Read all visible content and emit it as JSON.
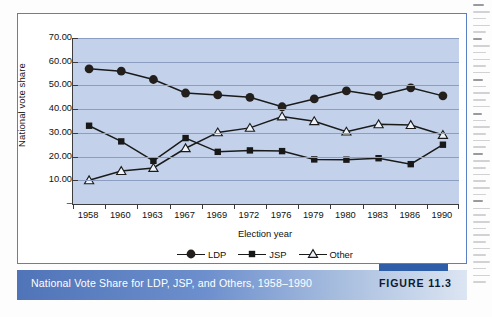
{
  "figure": {
    "caption": "National Vote Share for LDP, JSP, and Others, 1958–1990",
    "number_label": "FIGURE 11.3"
  },
  "chart_data": {
    "type": "line",
    "title": "National Vote Share for LDP, JSP, and Others, 1958–1990",
    "xlabel": "Election year",
    "ylabel": "National vote share",
    "categories": [
      "1958",
      "1960",
      "1963",
      "1967",
      "1969",
      "1972",
      "1976",
      "1979",
      "1980",
      "1983",
      "1986",
      "1990"
    ],
    "ytick_labels": [
      "70.00",
      "60.00",
      "50.00",
      "40.00",
      "30.00",
      "20.00",
      "10.00",
      "–"
    ],
    "ytick_values": [
      70,
      60,
      50,
      40,
      30,
      20,
      10,
      0
    ],
    "ylim": [
      0,
      70
    ],
    "grid": true,
    "legend_position": "bottom",
    "series": [
      {
        "name": "LDP",
        "marker": "filled-circle",
        "values": [
          57.0,
          56.0,
          52.5,
          46.8,
          46.0,
          45.0,
          41.0,
          44.3,
          47.7,
          45.7,
          49.0,
          45.6
        ]
      },
      {
        "name": "JSP",
        "marker": "filled-square",
        "values": [
          33.0,
          26.4,
          18.2,
          27.8,
          22.0,
          22.6,
          22.3,
          18.8,
          18.7,
          19.3,
          16.8,
          25.0
        ]
      },
      {
        "name": "Other",
        "marker": "open-triangle",
        "values": [
          10.0,
          13.9,
          15.2,
          23.5,
          30.2,
          32.1,
          36.9,
          34.9,
          30.5,
          33.6,
          33.3,
          29.1
        ]
      }
    ]
  },
  "legend": {
    "items": [
      {
        "label": "LDP",
        "marker": "filled-circle"
      },
      {
        "label": "JSP",
        "marker": "filled-square"
      },
      {
        "label": "Other",
        "marker": "open-triangle"
      }
    ]
  },
  "colors": {
    "plot_background": "#c3d2ea",
    "gridline": "#8b9ec2",
    "axis": "#3d3d3d",
    "series_ink": "#1a1a1a",
    "card_border": "#5b7fc4",
    "caption_start": "#5074b8",
    "caption_end": "#dce5f2",
    "figure_tab": "#2f5ea8"
  }
}
